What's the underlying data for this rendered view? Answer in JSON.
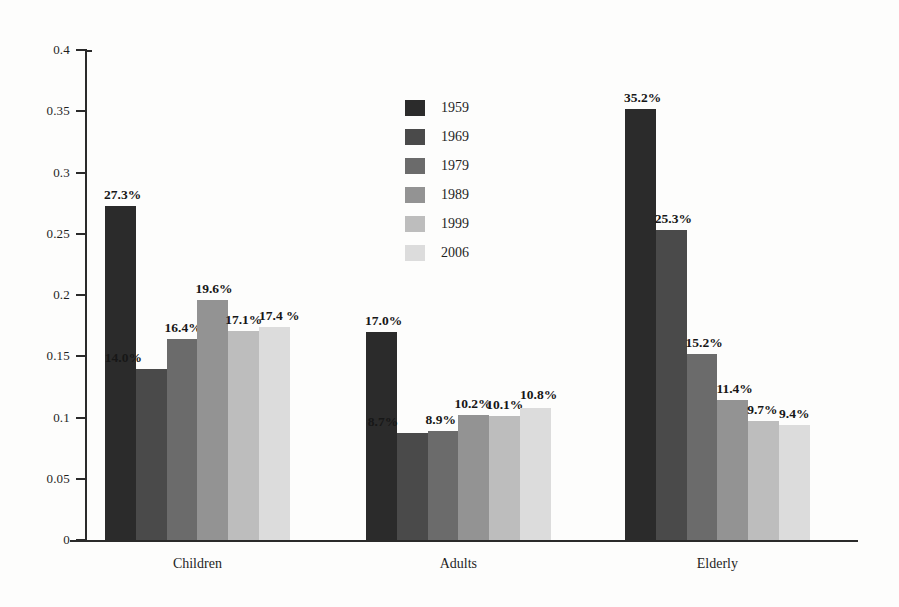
{
  "chart_data": {
    "type": "bar",
    "title": "",
    "subtitle": "",
    "xlabel": "",
    "ylabel": "",
    "grid": false,
    "legend_position": "inside-top-center",
    "ylim": [
      0,
      0.4
    ],
    "ytick_labels": [
      "0.4",
      "0.35",
      "0.3",
      "0.25",
      "0.2",
      "0.15",
      "0.1",
      "0.05",
      "0"
    ],
    "ytick_values": [
      0.4,
      0.35,
      0.3,
      0.25,
      0.2,
      0.15,
      0.1,
      0.05,
      0
    ],
    "categories": [
      "Children",
      "Adults",
      "Elderly"
    ],
    "series": [
      {
        "name": "1959",
        "color": "#2b2b2b",
        "values": [
          0.273,
          0.17,
          0.352
        ],
        "labels": [
          "27.3%",
          "17.0%",
          "35.2%"
        ]
      },
      {
        "name": "1969",
        "color": "#4a4a4a",
        "values": [
          0.14,
          0.087,
          0.253
        ],
        "labels": [
          "14.0%",
          "8.7%",
          "25.3%"
        ]
      },
      {
        "name": "1979",
        "color": "#6b6b6b",
        "values": [
          0.164,
          0.089,
          0.152
        ],
        "labels": [
          "16.4%",
          "8.9%",
          "15.2%"
        ]
      },
      {
        "name": "1989",
        "color": "#939393",
        "values": [
          0.196,
          0.102,
          0.114
        ],
        "labels": [
          "19.6%",
          "10.2%",
          "11.4%"
        ]
      },
      {
        "name": "1999",
        "color": "#bdbdbd",
        "values": [
          0.171,
          0.101,
          0.097
        ],
        "labels": [
          "17.1%",
          "10.1%",
          "9.7%"
        ]
      },
      {
        "name": "2006",
        "color": "#dcdcdc",
        "values": [
          0.174,
          0.108,
          0.094
        ],
        "labels": [
          "17.4 %",
          "10.8%",
          "9.4%"
        ]
      }
    ]
  },
  "legend": {
    "items": [
      {
        "label": "1959",
        "color": "#2b2b2b"
      },
      {
        "label": "1969",
        "color": "#4a4a4a"
      },
      {
        "label": "1979",
        "color": "#6b6b6b"
      },
      {
        "label": "1989",
        "color": "#939393"
      },
      {
        "label": "1999",
        "color": "#bdbdbd"
      },
      {
        "label": "2006",
        "color": "#dcdcdc"
      }
    ]
  }
}
